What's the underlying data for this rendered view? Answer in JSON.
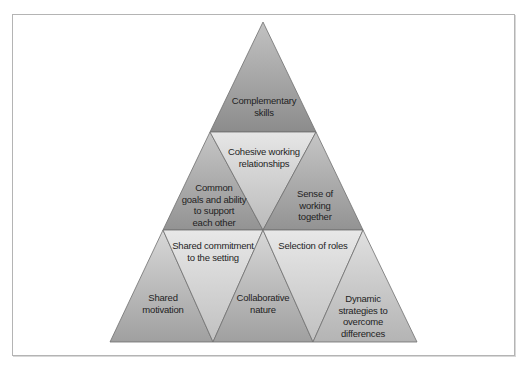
{
  "diagram": {
    "type": "triangular pyramid",
    "rows": [
      {
        "row": 1,
        "cells": [
          {
            "id": "complementary-skills",
            "label": "Complementary\nskills",
            "orientation": "up",
            "color_top": "#bdbdbd",
            "color_bottom": "#8e8e8e"
          }
        ]
      },
      {
        "row": 2,
        "cells": [
          {
            "id": "common-goals",
            "label": "Common\ngoals and ability\nto support\neach other",
            "orientation": "up",
            "color_top": "#c4c4c4",
            "color_bottom": "#959595"
          },
          {
            "id": "cohesive-working",
            "label": "Cohesive working\nrelationships",
            "orientation": "down",
            "color_top": "#e4e4e4",
            "color_bottom": "#bcbcbc"
          },
          {
            "id": "sense-of-working",
            "label": "Sense of\nworking\ntogether",
            "orientation": "up",
            "color_top": "#c4c4c4",
            "color_bottom": "#959595"
          }
        ]
      },
      {
        "row": 3,
        "cells": [
          {
            "id": "shared-motivation",
            "label": "Shared\nmotivation",
            "orientation": "up",
            "color_top": "#d4d4d4",
            "color_bottom": "#a2a2a2"
          },
          {
            "id": "shared-commitment",
            "label": "Shared commitment\nto the setting",
            "orientation": "down",
            "color_top": "#e6e6e6",
            "color_bottom": "#c2c2c2"
          },
          {
            "id": "collaborative-nature",
            "label": "Collaborative\nnature",
            "orientation": "up",
            "color_top": "#d4d4d4",
            "color_bottom": "#a2a2a2"
          },
          {
            "id": "selection-of-roles",
            "label": "Selection of roles",
            "orientation": "down",
            "color_top": "#e6e6e6",
            "color_bottom": "#c2c2c2"
          },
          {
            "id": "dynamic-strategies",
            "label": "Dynamic\nstrategies to\novercome\ndifferences",
            "orientation": "up",
            "color_top": "#dadada",
            "color_bottom": "#b2b2b2"
          }
        ]
      }
    ],
    "colors": {
      "edge": "#6e6e6e",
      "frame": "#b4b4b4",
      "text": "#1e1e1e"
    }
  },
  "labels": {
    "complementary_skills": [
      "Complementary",
      "skills"
    ],
    "cohesive_working": [
      "Cohesive working",
      "relationships"
    ],
    "common_goals": [
      "Common",
      "goals and ability",
      "to support",
      "each other"
    ],
    "sense_of_working": [
      "Sense of",
      "working",
      "together"
    ],
    "shared_commitment": [
      "Shared commitment",
      "to the setting"
    ],
    "selection_of_roles": [
      "Selection of roles"
    ],
    "shared_motivation": [
      "Shared",
      "motivation"
    ],
    "collaborative_nature": [
      "Collaborative",
      "nature"
    ],
    "dynamic_strategies": [
      "Dynamic",
      "strategies to",
      "overcome",
      "differences"
    ]
  }
}
